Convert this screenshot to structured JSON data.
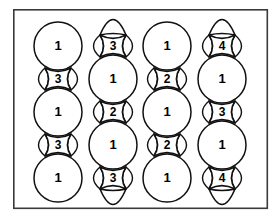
{
  "figure": {
    "background_color": "#ffffff",
    "frame": {
      "stroke_color": "#3a3a3a",
      "fill_color": "#ffffff",
      "x": 13,
      "y": 9,
      "width": 255,
      "height": 200
    },
    "shape_stroke_color": "#111111",
    "shape_fill_color": "#ffffff",
    "label_color": "#000000",
    "geometry": {
      "circle_radius": 24,
      "column_centers_x": [
        58,
        113,
        167,
        222
      ],
      "bead_spacing_y": 44,
      "neck_half_width": 13,
      "neck_half_height": 11,
      "cap_half_height": 11
    },
    "columns": [
      {
        "id": "column-1",
        "center_x": 58,
        "top_kind": "circle",
        "bottom_kind": "circle",
        "first_circle_center_y": 46,
        "beads": [
          {
            "kind": "circle",
            "center_y": 46,
            "label": "1"
          },
          {
            "kind": "neck",
            "center_y": 68,
            "label": "3"
          },
          {
            "kind": "circle",
            "center_y": 90,
            "label": "1"
          },
          {
            "kind": "neck",
            "center_y": 134,
            "label": "3"
          },
          {
            "kind": "circle",
            "center_y": 156,
            "label": "1"
          }
        ],
        "circle_centers_y": [
          46,
          112,
          178
        ],
        "neck_centers_y": [
          79,
          145
        ],
        "circle_labels": [
          "1",
          "1",
          "1"
        ],
        "neck_labels": [
          "3",
          "3"
        ]
      },
      {
        "id": "column-2",
        "center_x": 113,
        "top_kind": "cap",
        "bottom_kind": "cap",
        "circle_centers_y": [
          79,
          145
        ],
        "neck_centers_y": [
          46,
          112,
          178
        ],
        "circle_labels": [
          "1",
          "1"
        ],
        "neck_labels": [
          "3",
          "2",
          "3"
        ],
        "top_cap_y": 35,
        "bottom_cap_y": 189
      },
      {
        "id": "column-3",
        "center_x": 167,
        "top_kind": "circle",
        "bottom_kind": "circle",
        "circle_centers_y": [
          46,
          112,
          178
        ],
        "neck_centers_y": [
          79,
          145
        ],
        "circle_labels": [
          "1",
          "1",
          "1"
        ],
        "neck_labels": [
          "2",
          "2"
        ]
      },
      {
        "id": "column-4",
        "center_x": 222,
        "top_kind": "cap",
        "bottom_kind": "cap",
        "circle_centers_y": [
          79,
          145
        ],
        "neck_centers_y": [
          46,
          112,
          178
        ],
        "circle_labels": [
          "1",
          "1"
        ],
        "neck_labels": [
          "4",
          "3",
          "4"
        ],
        "top_cap_y": 35,
        "bottom_cap_y": 189
      }
    ]
  }
}
